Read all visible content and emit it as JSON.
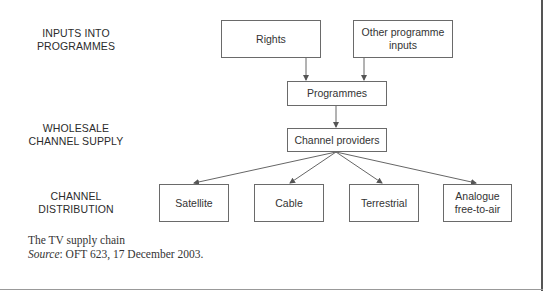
{
  "diagram": {
    "type": "flowchart",
    "stages": [
      {
        "id": "inputs",
        "label_line1": "INPUTS INTO",
        "label_line2": "PROGRAMMES"
      },
      {
        "id": "wholesale",
        "label_line1": "WHOLESALE",
        "label_line2": "CHANNEL SUPPLY"
      },
      {
        "id": "distribution",
        "label_line1": "CHANNEL",
        "label_line2": "DISTRIBUTION"
      }
    ],
    "nodes": {
      "rights": "Rights",
      "other_inputs_line1": "Other programme",
      "other_inputs_line2": "inputs",
      "programmes": "Programmes",
      "channel_providers": "Channel providers",
      "satellite": "Satellite",
      "cable": "Cable",
      "terrestrial": "Terrestrial",
      "analogue_line1": "Analogue",
      "analogue_line2": "free-to-air"
    },
    "edges": [
      [
        "Rights",
        "Programmes"
      ],
      [
        "Other programme inputs",
        "Programmes"
      ],
      [
        "Programmes",
        "Channel providers"
      ],
      [
        "Channel providers",
        "Satellite"
      ],
      [
        "Channel providers",
        "Cable"
      ],
      [
        "Channel providers",
        "Terrestrial"
      ],
      [
        "Channel providers",
        "Analogue free-to-air"
      ]
    ]
  },
  "caption": {
    "title": "The TV supply chain",
    "source_label": "Source",
    "source_text": ": OFT 623, 17 December 2003."
  }
}
